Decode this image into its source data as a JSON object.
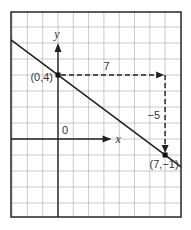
{
  "diagram": {
    "type": "coordinate-graph",
    "grid": {
      "x_range": [
        -3,
        8
      ],
      "y_range": [
        -5,
        8
      ],
      "step": 1
    },
    "axes": {
      "x_label": "x",
      "y_label": "y",
      "origin_label": "0",
      "x_axis_end": 3.5,
      "y_axis_end": 6
    },
    "line": {
      "equation": "y = 4 - (5/7)x",
      "slope": -0.7142857,
      "intercept": 4
    },
    "points": [
      {
        "x": 0,
        "y": 4,
        "label": "(0,4)"
      },
      {
        "x": 7,
        "y": -1,
        "label": "(7,−1)"
      }
    ],
    "run": {
      "value": 7,
      "label": "7"
    },
    "rise": {
      "value": -5,
      "label": "−5"
    },
    "colors": {
      "ink": "#222222",
      "grid": "#bdbdbd"
    }
  }
}
